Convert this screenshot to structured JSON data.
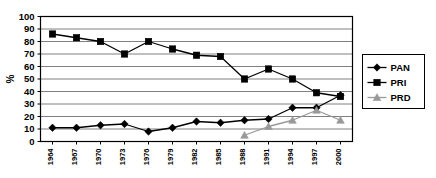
{
  "chart_data": {
    "type": "line",
    "title": "",
    "xlabel": "",
    "ylabel": "%",
    "ylim": [
      0,
      100
    ],
    "ytick_step": 10,
    "grid": true,
    "legend_position": "right",
    "categories": [
      "1964",
      "1967",
      "1970",
      "1973",
      "1976",
      "1979",
      "1982",
      "1985",
      "1988",
      "1991",
      "1994",
      "1997",
      "2000"
    ],
    "yticks": [
      "0",
      "10",
      "20",
      "30",
      "40",
      "50",
      "60",
      "70",
      "80",
      "90",
      "100"
    ],
    "series": [
      {
        "name": "PAN",
        "marker": "diamond",
        "color": "#000000",
        "values": [
          11,
          11,
          13,
          14,
          8,
          11,
          16,
          15,
          17,
          18,
          27,
          27,
          37
        ]
      },
      {
        "name": "PRI",
        "marker": "square",
        "color": "#000000",
        "values": [
          86,
          83,
          80,
          70,
          80,
          74,
          69,
          68,
          50,
          58,
          50,
          39,
          36
        ]
      },
      {
        "name": "PRD",
        "marker": "triangle",
        "color": "#999999",
        "values": [
          null,
          null,
          null,
          null,
          null,
          null,
          null,
          null,
          5,
          12,
          17,
          25,
          17
        ]
      }
    ]
  },
  "legend": {
    "items": [
      {
        "label": "PAN",
        "marker": "diamond",
        "color": "#000000"
      },
      {
        "label": "PRI",
        "marker": "square",
        "color": "#000000"
      },
      {
        "label": "PRD",
        "marker": "triangle",
        "color": "#999999"
      }
    ]
  },
  "colors": {
    "plot_border": "#000000",
    "gridline": "#808080",
    "background": "#ffffff",
    "pan": "#000000",
    "pri": "#000000",
    "prd": "#999999"
  }
}
